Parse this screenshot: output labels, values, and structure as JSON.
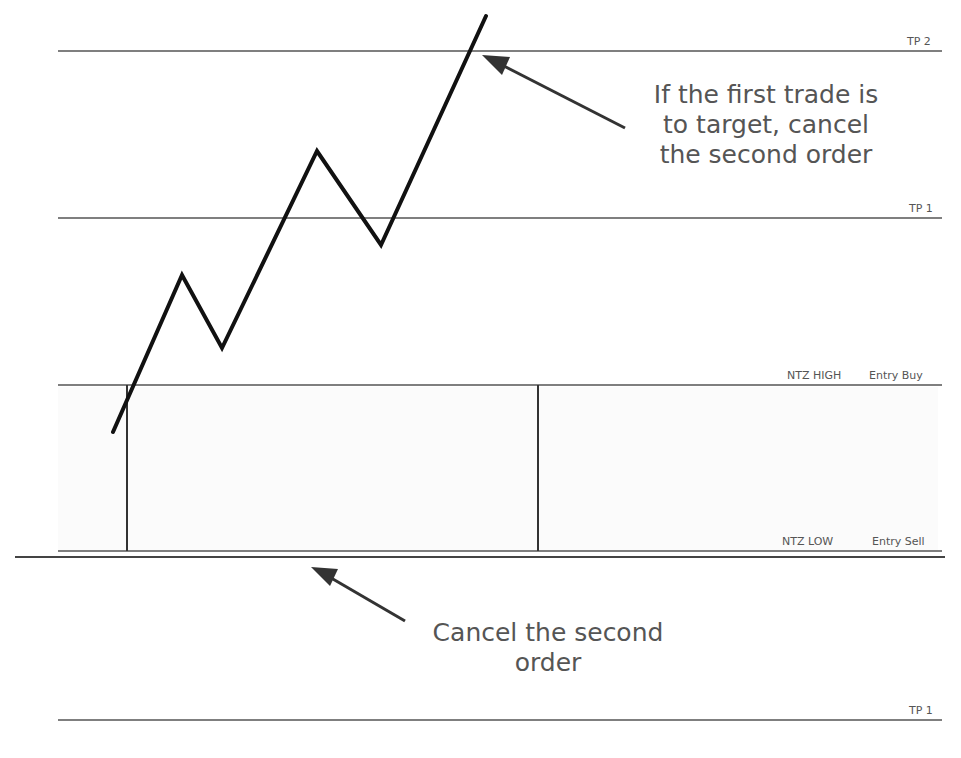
{
  "diagram": {
    "levels": [
      {
        "id": "tp2",
        "label": "TP 2",
        "y": 51
      },
      {
        "id": "tp1-upper",
        "label": "TP 1",
        "y": 218
      },
      {
        "id": "ntz-high",
        "label": "NTZ HIGH",
        "entry_label": "Entry Buy",
        "y": 385
      },
      {
        "id": "ntz-low",
        "label": "NTZ LOW",
        "entry_label": "Entry Sell",
        "y": 552
      },
      {
        "id": "tp1-lower",
        "label": "TP 1",
        "y": 720
      }
    ],
    "annotations": {
      "top": [
        "If the first trade is",
        "to target, cancel",
        "the second order"
      ],
      "bottom": [
        "Cancel the second",
        "order"
      ]
    },
    "price_path_points": [
      [
        113,
        432
      ],
      [
        182,
        275
      ],
      [
        222,
        348
      ],
      [
        317,
        151
      ],
      [
        381,
        245
      ],
      [
        486,
        16
      ]
    ],
    "line_color": "#111111",
    "level_color": "#555555",
    "text_color": "#555555"
  }
}
